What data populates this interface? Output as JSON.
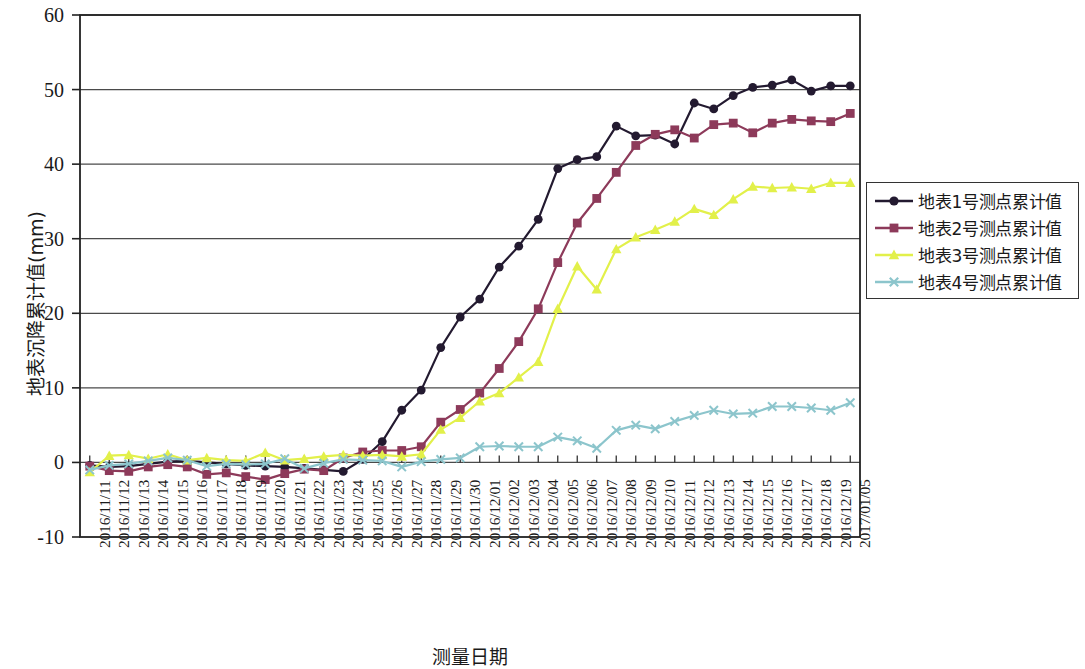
{
  "chart_data": {
    "type": "line",
    "title": "",
    "xlabel": "测量日期",
    "ylabel": "地表沉降累计值(mm)",
    "ylim": [
      -10,
      60
    ],
    "ytick_labels": [
      "60",
      "50",
      "40",
      "30",
      "20",
      "10",
      "0",
      "-10"
    ],
    "ytick_values": [
      60,
      50,
      40,
      30,
      20,
      10,
      0,
      -10
    ],
    "grid": true,
    "grid_axis": "y",
    "legend_position": "right",
    "categories": [
      "2016/11/11",
      "2016/11/12",
      "2016/11/13",
      "2016/11/14",
      "2016/11/15",
      "2016/11/16",
      "2016/11/17",
      "2016/11/18",
      "2016/11/19",
      "2016/11/20",
      "2016/11/21",
      "2016/11/22",
      "2016/11/23",
      "2016/11/24",
      "2016/11/25",
      "2016/11/26",
      "2016/11/27",
      "2016/11/28",
      "2016/11/29",
      "2016/11/30",
      "2016/12/01",
      "2016/12/02",
      "2016/12/03",
      "2016/12/04",
      "2016/12/05",
      "2016/12/06",
      "2016/12/07",
      "2016/12/08",
      "2016/12/09",
      "2016/12/10",
      "2016/12/11",
      "2016/12/12",
      "2016/12/13",
      "2016/12/14",
      "2016/12/15",
      "2016/12/16",
      "2016/12/17",
      "2016/12/18",
      "2016/12/19",
      "2017/01/05"
    ],
    "series": [
      {
        "name": "地表1号测点累计值",
        "color": "#231a30",
        "marker": "circle",
        "values": [
          -0.4,
          -0.6,
          -0.5,
          -0.2,
          0.1,
          0.2,
          0.0,
          -0.2,
          -0.4,
          -0.5,
          -0.6,
          -0.8,
          -1.0,
          -1.2,
          0.4,
          2.8,
          7.0,
          9.7,
          15.4,
          19.5,
          21.9,
          26.2,
          29.0,
          32.6,
          39.4,
          40.6,
          41.0,
          45.1,
          43.8,
          43.9,
          42.7,
          48.2,
          47.4,
          49.2,
          50.3,
          50.6,
          51.3,
          49.8,
          50.5,
          50.5
        ]
      },
      {
        "name": "地表2号测点累计值",
        "color": "#8d3a5a",
        "marker": "square",
        "values": [
          -0.5,
          -1.1,
          -1.2,
          -0.6,
          -0.3,
          -0.6,
          -1.6,
          -1.4,
          -1.9,
          -2.3,
          -1.5,
          -0.9,
          -1.1,
          0.6,
          1.4,
          1.6,
          1.6,
          2.1,
          5.4,
          7.1,
          9.3,
          12.6,
          16.2,
          20.6,
          26.8,
          32.1,
          35.4,
          38.9,
          42.5,
          44.0,
          44.6,
          43.5,
          45.3,
          45.5,
          44.2,
          45.5,
          46.0,
          45.8,
          45.7,
          46.8
        ]
      },
      {
        "name": "地表3号测点累计值",
        "color": "#e2f04a",
        "marker": "triangle",
        "values": [
          -1.3,
          0.9,
          1.0,
          0.5,
          1.1,
          0.3,
          0.6,
          0.3,
          0.2,
          1.3,
          0.3,
          0.5,
          0.8,
          1.0,
          0.9,
          1.0,
          0.8,
          1.1,
          4.4,
          6.0,
          8.2,
          9.3,
          11.4,
          13.5,
          20.6,
          26.3,
          23.2,
          28.6,
          30.2,
          31.2,
          32.3,
          34.0,
          33.2,
          35.3,
          37.0,
          36.8,
          36.9,
          36.7,
          37.5,
          37.5
        ]
      },
      {
        "name": "地表4号测点累计值",
        "color": "#8cc5cc",
        "marker": "x",
        "values": [
          -1.0,
          -0.4,
          -0.2,
          0.2,
          0.6,
          0.3,
          -0.5,
          -0.2,
          -0.3,
          -0.2,
          0.5,
          -0.8,
          -0.1,
          0.4,
          0.3,
          0.2,
          -0.6,
          0.1,
          0.4,
          0.6,
          2.1,
          2.2,
          2.1,
          2.1,
          3.4,
          2.9,
          1.9,
          4.3,
          5.0,
          4.5,
          5.5,
          6.3,
          7.0,
          6.5,
          6.6,
          7.5,
          7.5,
          7.3,
          7.0,
          8.0
        ]
      }
    ]
  },
  "legend": {
    "entries": [
      {
        "label": "地表1号测点累计值"
      },
      {
        "label": "地表2号测点累计值"
      },
      {
        "label": "地表3号测点累计值"
      },
      {
        "label": "地表4号测点累计值"
      }
    ]
  },
  "axes": {
    "y_title": "地表沉降累计值(mm)",
    "x_title": "测量日期"
  }
}
